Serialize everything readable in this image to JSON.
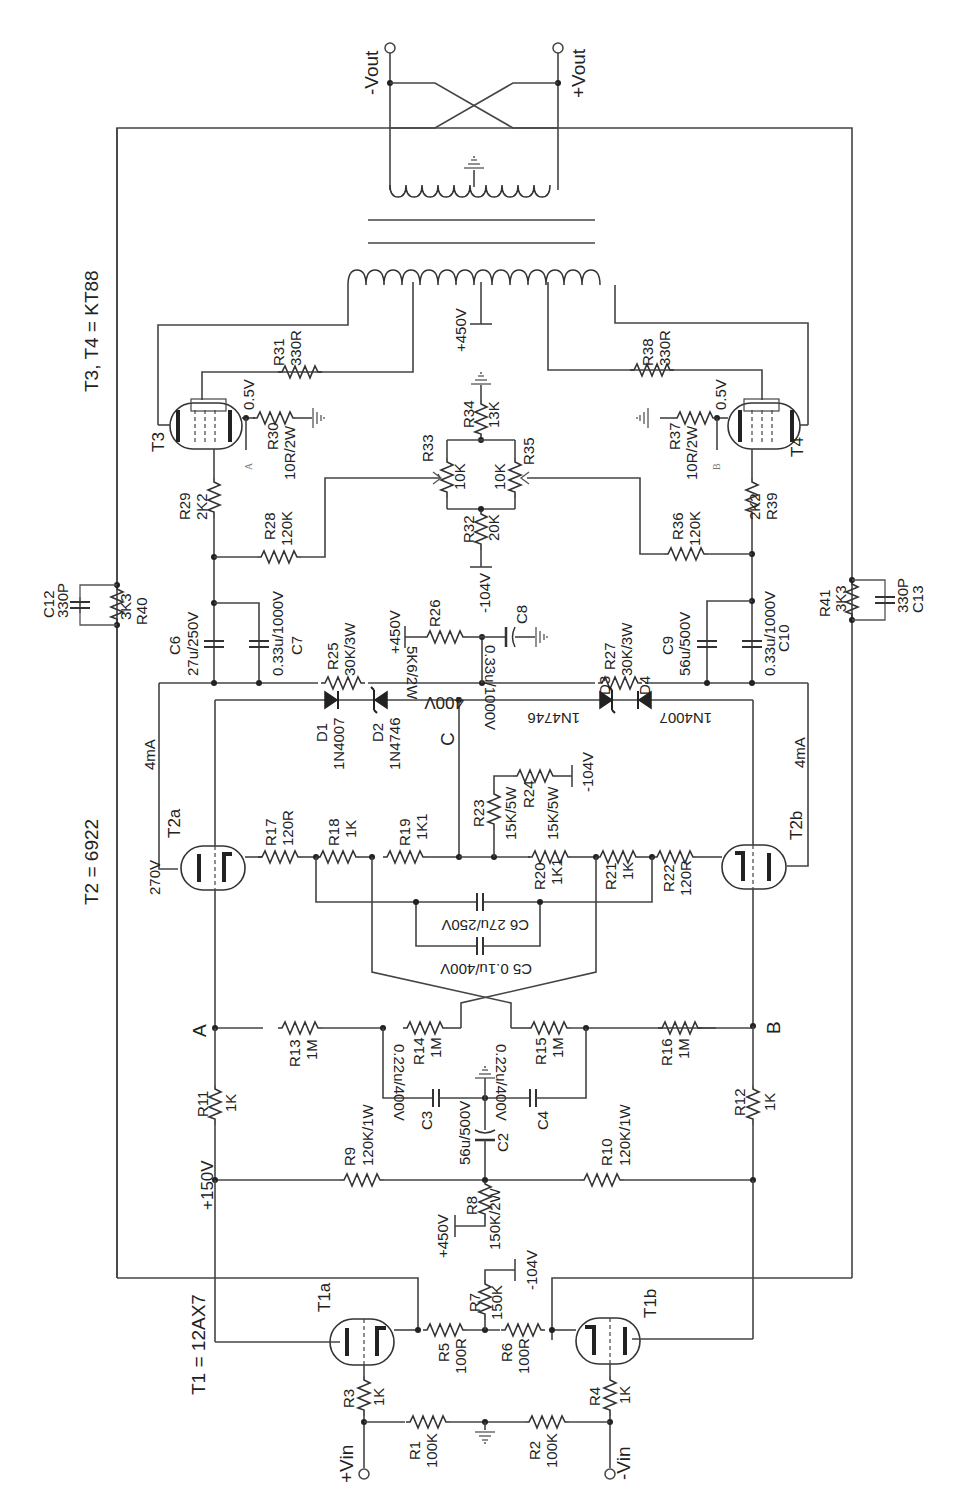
{
  "title_notes": {
    "t1": "T1 = 12AX7",
    "t2": "T2 = 6922",
    "t34": "T3, T4 = KT88"
  },
  "terminals": {
    "vin_pos": "+Vin",
    "vin_neg": "-Vin",
    "vout_neg": "-Vout",
    "vout_pos": "+Vout"
  },
  "nodes": {
    "a": "A",
    "b": "B",
    "c": "C",
    "a_small": "A",
    "b_small": "B"
  },
  "tubes": {
    "t1a": "T1a",
    "t1b": "T1b",
    "t2a": "T2a",
    "t2b": "T2b",
    "t3": "T3",
    "t4": "T4"
  },
  "voltages": {
    "v150": "+150V",
    "v450_r8": "+450V",
    "vneg104_r7": "-104V",
    "vneg104_r24": "-104V",
    "vneg104_r32": "-104V",
    "v450_r26": "+450V",
    "v400": "400V",
    "v270": "270V",
    "v450_trafo": "+450V",
    "v05_t3": "0.5V",
    "v05_t4": "0.5V"
  },
  "currents": {
    "i_t2a": "4mA",
    "i_t2b": "4mA"
  },
  "resistors": [
    {
      "ref": "R1",
      "value": "100K"
    },
    {
      "ref": "R2",
      "value": "100K"
    },
    {
      "ref": "R3",
      "value": "1K"
    },
    {
      "ref": "R4",
      "value": "1K"
    },
    {
      "ref": "R5",
      "value": "100R"
    },
    {
      "ref": "R6",
      "value": "100R"
    },
    {
      "ref": "R7",
      "value": "150K"
    },
    {
      "ref": "R8",
      "value": "150K/2W"
    },
    {
      "ref": "R9",
      "value": "120K/1W"
    },
    {
      "ref": "R10",
      "value": "120K/1W"
    },
    {
      "ref": "R11",
      "value": "1K"
    },
    {
      "ref": "R12",
      "value": "1K"
    },
    {
      "ref": "R13",
      "value": "1M"
    },
    {
      "ref": "R14",
      "value": "1M"
    },
    {
      "ref": "R15",
      "value": "1M"
    },
    {
      "ref": "R16",
      "value": "1M"
    },
    {
      "ref": "R17",
      "value": "120R"
    },
    {
      "ref": "R18",
      "value": "1K"
    },
    {
      "ref": "R19",
      "value": "1K1"
    },
    {
      "ref": "R20",
      "value": "1K1"
    },
    {
      "ref": "R21",
      "value": "1K"
    },
    {
      "ref": "R22",
      "value": "120R"
    },
    {
      "ref": "R23",
      "value": "15K/5W"
    },
    {
      "ref": "R24",
      "value": "15K/5W"
    },
    {
      "ref": "R25",
      "value": "30K/3W"
    },
    {
      "ref": "R26",
      "value": "5K6/2W"
    },
    {
      "ref": "R27",
      "value": "30K/3W"
    },
    {
      "ref": "R28",
      "value": "120K"
    },
    {
      "ref": "R29",
      "value": "2K2"
    },
    {
      "ref": "R30",
      "value": "10R/2W"
    },
    {
      "ref": "R31",
      "value": "330R"
    },
    {
      "ref": "R32",
      "value": "20K"
    },
    {
      "ref": "R33",
      "value": "10K"
    },
    {
      "ref": "R34",
      "value": "13K"
    },
    {
      "ref": "R35",
      "value": "10K"
    },
    {
      "ref": "R36",
      "value": "120K"
    },
    {
      "ref": "R37",
      "value": "10R/2W"
    },
    {
      "ref": "R38",
      "value": "330R"
    },
    {
      "ref": "R39",
      "value": "2K2"
    },
    {
      "ref": "R40",
      "value": "3K3"
    },
    {
      "ref": "R41",
      "value": "3K3"
    }
  ],
  "capacitors": [
    {
      "ref": "C2",
      "value": "56u/500V"
    },
    {
      "ref": "C3",
      "value": "0.22u/400V"
    },
    {
      "ref": "C4",
      "value": "0.22u/400V"
    },
    {
      "ref": "C5",
      "value": "0.1u/400V"
    },
    {
      "ref": "C6",
      "value": "27u/250V"
    },
    {
      "ref": "C7",
      "value": "0.33u/1000V"
    },
    {
      "ref": "C8",
      "value": "0.33u/1000V"
    },
    {
      "ref": "C9",
      "value": "56u/500V"
    },
    {
      "ref": "C10",
      "value": "0.33u/1000V"
    },
    {
      "ref": "C11",
      "value": "0.33u/1000V"
    },
    {
      "ref": "C12",
      "value": "330P"
    },
    {
      "ref": "C13",
      "value": "330P"
    }
  ],
  "diodes": [
    {
      "ref": "D1",
      "value": "1N4007"
    },
    {
      "ref": "D2",
      "value": "1N4746"
    },
    {
      "ref": "D3",
      "value": "1N4746"
    },
    {
      "ref": "D4",
      "value": "1N4007"
    }
  ],
  "combined_labels": {
    "c5": "C5  0.1u/400V",
    "c6": "C6  27u/250V"
  }
}
